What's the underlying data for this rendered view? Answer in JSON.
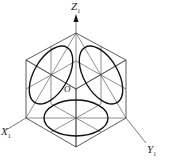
{
  "diagram": {
    "type": "isometric cube with inscribed ellipses",
    "labels": {
      "z_axis": "Z",
      "z_sub": "1",
      "x_axis": "X",
      "x_sub": "1",
      "y_axis": "Y",
      "y_sub": "1",
      "origin": "O"
    },
    "colors": {
      "line": "#333333",
      "ellipse": "#111111",
      "background": "#ffffff"
    }
  }
}
